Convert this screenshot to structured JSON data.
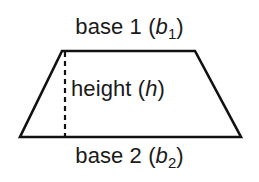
{
  "figure": {
    "background_color": "#ffffff",
    "stroke_color": "#111111",
    "text_color": "#1a1a1a",
    "width": 259,
    "height": 182
  },
  "shape": {
    "name": "trapezoid",
    "top_left": [
      62,
      51
    ],
    "top_right": [
      195,
      51
    ],
    "bottom_right": [
      241,
      137
    ],
    "bottom_left": [
      20,
      137
    ],
    "stroke_width": 2.6
  },
  "height_line": {
    "name": "height-dashed-line",
    "x": 65,
    "y_start": 52,
    "y_end": 137,
    "dash": "5 4",
    "stroke_width": 2.2
  },
  "labels": {
    "base1": {
      "prefix": "base 1 (",
      "variable": "b",
      "subscript": "1",
      "suffix": ")",
      "full_text": "base 1 (b1)"
    },
    "height": {
      "prefix": "height (",
      "variable": "h",
      "subscript": "",
      "suffix": ")",
      "full_text": "height (h)"
    },
    "base2": {
      "prefix": "base 2 (",
      "variable": "b",
      "subscript": "2",
      "suffix": ")",
      "full_text": "base 2 (b2)"
    }
  }
}
